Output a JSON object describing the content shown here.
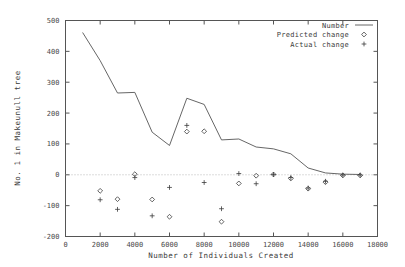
{
  "chart_data": {
    "type": "line",
    "title": "",
    "xlabel": "Number of Individuals Created",
    "ylabel": "No. 1 in Makeunull tree",
    "xlim": [
      0,
      18000
    ],
    "ylim": [
      -200,
      500
    ],
    "xticks": [
      0,
      2000,
      4000,
      6000,
      8000,
      10000,
      12000,
      14000,
      16000,
      18000
    ],
    "yticks": [
      -200,
      -100,
      0,
      100,
      200,
      300,
      400,
      500
    ],
    "xtick_labels": [
      "0",
      "2000",
      "4000",
      "6000",
      "8000",
      "10000",
      "12000",
      "14000",
      "16000",
      "18000"
    ],
    "ytick_labels": [
      "-200",
      "-100",
      "0",
      "100",
      "200",
      "300",
      "400",
      "500"
    ],
    "grid": false,
    "zero_line": 0,
    "legend_position": "top-right",
    "legend": [
      {
        "name": "Number",
        "marker": "line"
      },
      {
        "name": "Predicted change",
        "marker": "diamond"
      },
      {
        "name": "Actual change",
        "marker": "plus"
      }
    ],
    "series": [
      {
        "name": "Number",
        "marker": "line",
        "x": [
          1000,
          2000,
          3000,
          4000,
          5000,
          6000,
          7000,
          8000,
          9000,
          10000,
          11000,
          12000,
          13000,
          14000,
          15000,
          16000,
          17000
        ],
        "y": [
          460,
          370,
          265,
          267,
          138,
          95,
          248,
          228,
          113,
          116,
          90,
          84,
          68,
          22,
          6,
          2,
          1
        ]
      },
      {
        "name": "Predicted change",
        "marker": "diamond",
        "x": [
          2000,
          3000,
          4000,
          5000,
          6000,
          7000,
          8000,
          9000,
          10000,
          11000,
          12000,
          13000,
          14000,
          15000,
          16000,
          17000
        ],
        "y": [
          -52,
          -79,
          2,
          -80,
          -136,
          140,
          141,
          -152,
          -28,
          -3,
          1,
          -12,
          -45,
          -24,
          -2,
          -2
        ]
      },
      {
        "name": "Actual change",
        "marker": "plus",
        "x": [
          2000,
          3000,
          4000,
          5000,
          6000,
          7000,
          8000,
          9000,
          10000,
          11000,
          12000,
          13000,
          14000,
          15000,
          16000,
          17000
        ],
        "y": [
          -81,
          -112,
          -9,
          -133,
          -41,
          160,
          -25,
          -110,
          4,
          -29,
          1,
          -9,
          -43,
          -21,
          -1,
          -1
        ]
      }
    ]
  }
}
